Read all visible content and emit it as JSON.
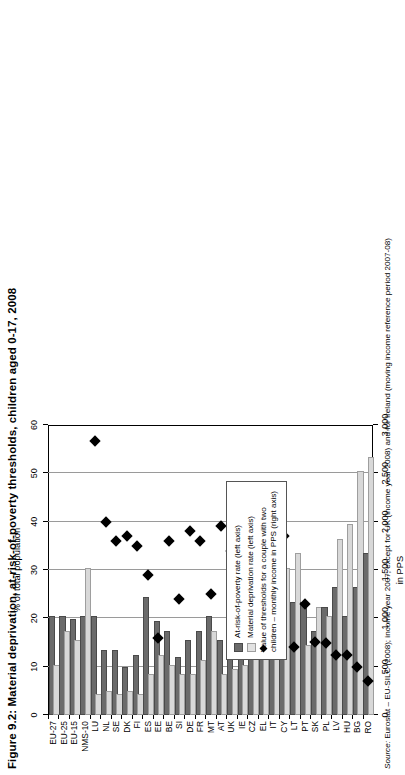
{
  "figure": {
    "title": "Figure 9.2: Material deprivation, at-risk-of-poverty thresholds, children aged 0-17, 2008",
    "source_prefix": "Source:",
    "source_text": " Eurostat – EU-SILC (2008); income year 2007; except for UK (income year 2008) and for Ireland (moving income reference period 2007-08)"
  },
  "legend": {
    "items": [
      {
        "marker": "square-dark-icon",
        "label": "At-risk-of-poverty rate (left axis)"
      },
      {
        "marker": "square-light-icon",
        "label": "Material deprivation rate (left axis)"
      },
      {
        "marker": "diamond-icon",
        "label": "Value of thresholds for a couple with two children – monthly income in PPS (right axis)"
      }
    ]
  },
  "chart_data": {
    "type": "bar",
    "title": "Figure 9.2: Material deprivation, at-risk-of-poverty thresholds, children aged 0-17, 2008",
    "orientation": "horizontal",
    "grid": true,
    "legend_position": "inside-right",
    "xlabel_top": "% of total population",
    "xlabel_bottom": "in PPS",
    "ylabel": "",
    "xlim_top": [
      0,
      60
    ],
    "xticks_top": [
      "0",
      "10",
      "20",
      "30",
      "40",
      "50",
      "60"
    ],
    "xtickvals_top": [
      0,
      10,
      20,
      30,
      40,
      50,
      60
    ],
    "xlim_bottom": [
      0,
      3000
    ],
    "xticks_bottom": [
      "0",
      "500",
      "1,000",
      "1,500",
      "2,000",
      "2,500",
      "3,000"
    ],
    "xtickvals_bottom": [
      0,
      500,
      1000,
      1500,
      2000,
      2500,
      3000
    ],
    "categories": [
      "EU-27",
      "EU-25",
      "EU-15",
      "NMS-10",
      "LU",
      "NL",
      "SE",
      "DK",
      "FI",
      "ES",
      "EE",
      "BE",
      "SI",
      "DE",
      "FR",
      "MT",
      "AT",
      "UK",
      "IE",
      "CZ",
      "EL",
      "IT",
      "CY",
      "LT",
      "PT",
      "SK",
      "PL",
      "LV",
      "HU",
      "BG",
      "RO"
    ],
    "series": [
      {
        "name": "At-risk-of-poverty rate (left axis)",
        "axis": "top",
        "unit": "%",
        "color": "#6b6b6b",
        "values": [
          20.0,
          20.0,
          19.5,
          20.0,
          20.0,
          13.0,
          13.0,
          9.5,
          12.0,
          24.0,
          19.0,
          17.0,
          11.5,
          15.0,
          17.0,
          20.0,
          15.0,
          23.0,
          18.0,
          13.0,
          23.0,
          25.0,
          14.0,
          23.0,
          23.0,
          17.0,
          22.0,
          26.0,
          20.0,
          26.0,
          33.0
        ]
      },
      {
        "name": "Material deprivation rate (left axis)",
        "axis": "top",
        "unit": "%",
        "color": "#d8d8d8",
        "values": [
          10.0,
          17.0,
          15.0,
          30.0,
          4.0,
          4.5,
          4.0,
          4.5,
          4.0,
          8.0,
          12.0,
          10.0,
          8.0,
          8.0,
          11.0,
          17.0,
          8.0,
          9.0,
          10.0,
          14.0,
          16.0,
          15.0,
          30.0,
          33.0,
          14.0,
          22.0,
          20.0,
          36.0,
          39.0,
          50.0,
          53.0
        ]
      },
      {
        "name": "Value of thresholds for a couple with two children – monthly income in PPS (right axis)",
        "axis": "bottom",
        "unit": "PPS",
        "color": "#000000",
        "values": [
          null,
          null,
          null,
          null,
          2830,
          2000,
          1800,
          1850,
          1750,
          1450,
          800,
          1800,
          1200,
          1900,
          1800,
          1250,
          1950,
          1700,
          1900,
          1100,
          1400,
          1550,
          1850,
          700,
          1150,
          750,
          740,
          620,
          620,
          500,
          350
        ]
      }
    ]
  }
}
